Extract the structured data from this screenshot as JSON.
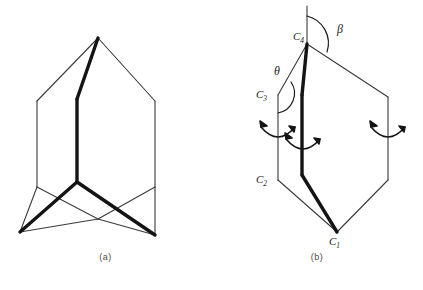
{
  "figure": {
    "background_color": "#ffffff",
    "line_color": "#1a1a1a",
    "thin_line_color": "#555555",
    "panels": [
      {
        "id": "a",
        "caption": "(a)",
        "description": "cyclohexane-like skeletal conformer drawing with bold highlighted bond path"
      },
      {
        "id": "b",
        "caption": "(b)",
        "description": "hexagon ring skeletal drawing with labelled carbons, angles and rotation arrows",
        "atom_labels": [
          {
            "name": "C1",
            "text": "C",
            "sub": "1"
          },
          {
            "name": "C2",
            "text": "C",
            "sub": "2"
          },
          {
            "name": "C3",
            "text": "C",
            "sub": "3"
          },
          {
            "name": "C4",
            "text": "C",
            "sub": "4"
          }
        ],
        "angle_labels": [
          {
            "name": "theta",
            "text": "θ"
          },
          {
            "name": "beta",
            "text": "β"
          }
        ],
        "rotation_arrows": 3
      }
    ]
  }
}
